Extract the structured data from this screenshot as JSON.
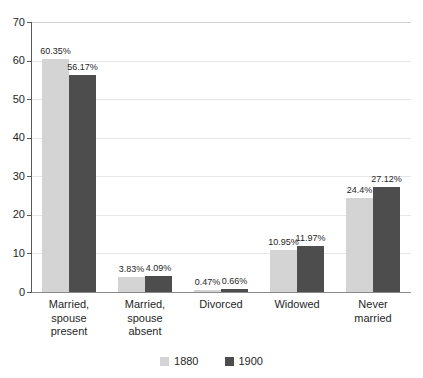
{
  "title": "",
  "chart_data": {
    "type": "bar",
    "title": "",
    "subtitle": "",
    "xlabel": "",
    "ylabel": "",
    "ylim": [
      0,
      70
    ],
    "ytick_step": 10,
    "yticks": [
      70,
      60,
      50,
      40,
      30,
      20,
      10,
      0
    ],
    "ytick_labels": [
      "70",
      "60",
      "50",
      "40",
      "30",
      "20",
      "10",
      "0"
    ],
    "grid": true,
    "grid_axis": "y",
    "legend_position": "bottom",
    "value_label_suffix": "%",
    "categories": [
      "Married,\nspouse\npresent",
      "Married,\nspouse\nabsent",
      "Divorced",
      "Widowed",
      "Never\nmarried"
    ],
    "series": [
      {
        "name": "1880",
        "color": "#d4d4d4",
        "values": [
          60.35,
          3.83,
          0.47,
          10.95,
          24.4
        ],
        "labels": [
          "60.35%",
          "3.83%",
          "0.47%",
          "10.95%",
          "24.4%"
        ]
      },
      {
        "name": "1900",
        "color": "#4d4d4d",
        "values": [
          56.17,
          4.09,
          0.66,
          11.97,
          27.12
        ],
        "labels": [
          "56.17%",
          "4.09%",
          "0.66%",
          "11.97%",
          "27.12%"
        ]
      }
    ]
  },
  "legend": {
    "items": [
      {
        "label": "1880",
        "color": "#d4d4d4"
      },
      {
        "label": "1900",
        "color": "#4d4d4d"
      }
    ]
  },
  "colors": {
    "series_1880": "#d4d4d4",
    "series_1900": "#4d4d4d",
    "gridline": "#e6e6e6",
    "axis": "#5a5a5a",
    "text": "#1f1f1f",
    "background": "#ffffff"
  }
}
